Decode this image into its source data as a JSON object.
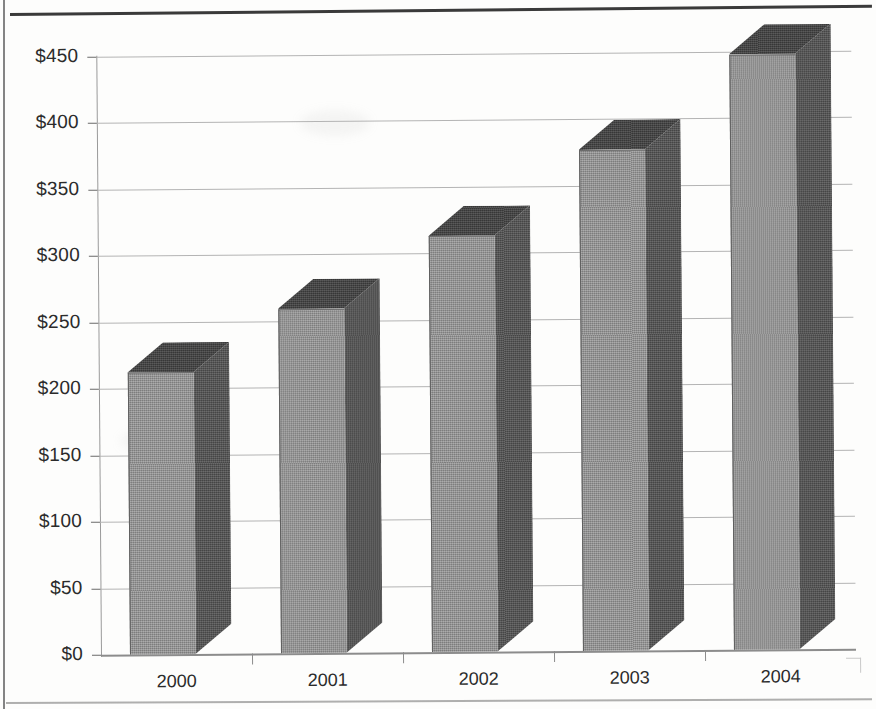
{
  "chart_data": {
    "type": "bar",
    "title": "",
    "subtitle": "",
    "xlabel": "",
    "ylabel": "",
    "categories": [
      "2000",
      "2001",
      "2002",
      "2003",
      "2004"
    ],
    "values": [
      212,
      259,
      313,
      377,
      448
    ],
    "value_prefix": "$",
    "ylim": [
      0,
      450
    ],
    "ytick_values": [
      0,
      50,
      100,
      150,
      200,
      250,
      300,
      350,
      400,
      450
    ],
    "ytick_labels": [
      "$0",
      "$50",
      "$100",
      "$150",
      "$200",
      "$250",
      "$300",
      "$350",
      "$400",
      "$450"
    ],
    "grid": true,
    "grid_axis": "y",
    "legend": null,
    "legend_position": "none",
    "annotations": [],
    "style": "3d-column",
    "series": [
      {
        "name": "Series 1",
        "values": [
          212,
          259,
          313,
          377,
          448
        ]
      }
    ],
    "colors": {
      "bar_front": "#8b8b8b",
      "bar_side": "#4e4e4e",
      "bar_top": "#3f3f3f",
      "gridline": "#b4b4b4",
      "axis": "#8c8c8c",
      "text": "#2b2b2b",
      "background": "#fdfdfc"
    }
  }
}
